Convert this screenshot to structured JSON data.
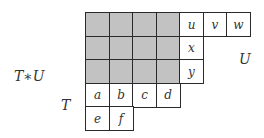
{
  "diagram": {
    "labels": {
      "tu": "T∗U",
      "t": "T",
      "u": "U"
    },
    "cell_size_px": 23.5,
    "origin": {
      "x": 85,
      "y": 12
    },
    "colors": {
      "shaded": "#c2c2c2",
      "empty": "#ffffff",
      "border": "#2a2a2a"
    },
    "rows": [
      {
        "cells": [
          {
            "col": 0,
            "shaded": true,
            "text": ""
          },
          {
            "col": 1,
            "shaded": true,
            "text": ""
          },
          {
            "col": 2,
            "shaded": true,
            "text": ""
          },
          {
            "col": 3,
            "shaded": true,
            "text": ""
          },
          {
            "col": 4,
            "shaded": false,
            "text": "u"
          },
          {
            "col": 5,
            "shaded": false,
            "text": "v"
          },
          {
            "col": 6,
            "shaded": false,
            "text": "w"
          }
        ]
      },
      {
        "cells": [
          {
            "col": 0,
            "shaded": true,
            "text": ""
          },
          {
            "col": 1,
            "shaded": true,
            "text": ""
          },
          {
            "col": 2,
            "shaded": true,
            "text": ""
          },
          {
            "col": 3,
            "shaded": true,
            "text": ""
          },
          {
            "col": 4,
            "shaded": false,
            "text": "x"
          }
        ]
      },
      {
        "cells": [
          {
            "col": 0,
            "shaded": true,
            "text": ""
          },
          {
            "col": 1,
            "shaded": true,
            "text": ""
          },
          {
            "col": 2,
            "shaded": true,
            "text": ""
          },
          {
            "col": 3,
            "shaded": true,
            "text": ""
          },
          {
            "col": 4,
            "shaded": false,
            "text": "y"
          }
        ]
      },
      {
        "cells": [
          {
            "col": 0,
            "shaded": false,
            "text": "a"
          },
          {
            "col": 1,
            "shaded": false,
            "text": "b"
          },
          {
            "col": 2,
            "shaded": false,
            "text": "c"
          },
          {
            "col": 3,
            "shaded": false,
            "text": "d"
          }
        ]
      },
      {
        "cells": [
          {
            "col": 0,
            "shaded": false,
            "text": "e"
          },
          {
            "col": 1,
            "shaded": false,
            "text": "f"
          }
        ]
      }
    ]
  }
}
